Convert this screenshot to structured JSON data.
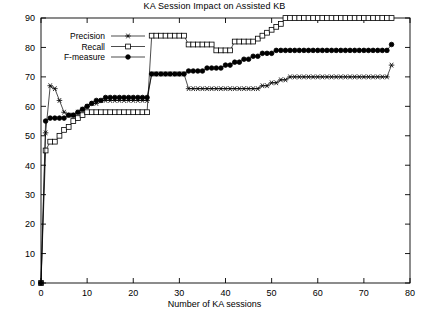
{
  "chart_data": {
    "type": "line",
    "title": "KA Session Impact on Assisted KB",
    "xlabel": "Number of KA sessions",
    "ylabel": "",
    "xlim": [
      0,
      80
    ],
    "ylim": [
      0,
      90
    ],
    "xticks": [
      0,
      10,
      20,
      30,
      40,
      50,
      60,
      70,
      80
    ],
    "yticks": [
      0,
      10,
      20,
      30,
      40,
      50,
      60,
      70,
      80,
      90
    ],
    "grid": false,
    "legend_position": "top-left",
    "x": [
      1,
      2,
      3,
      4,
      5,
      6,
      7,
      8,
      9,
      10,
      11,
      12,
      13,
      14,
      15,
      16,
      17,
      18,
      19,
      20,
      21,
      22,
      23,
      24,
      25,
      26,
      27,
      28,
      29,
      30,
      31,
      32,
      33,
      34,
      35,
      36,
      37,
      38,
      39,
      40,
      41,
      42,
      43,
      44,
      45,
      46,
      47,
      48,
      49,
      50,
      51,
      52,
      53,
      54,
      55,
      56,
      57,
      58,
      59,
      60,
      61,
      62,
      63,
      64,
      65,
      66,
      67,
      68,
      69,
      70,
      71,
      72,
      73,
      74,
      75,
      76
    ],
    "series": [
      {
        "name": "Precision",
        "marker": "star",
        "filled": false,
        "values": [
          51,
          67,
          66,
          62,
          58,
          57,
          57,
          58,
          59,
          60,
          61,
          61,
          62,
          62,
          62,
          62,
          62,
          62,
          62,
          62,
          62,
          62,
          62,
          71,
          71,
          71,
          71,
          71,
          71,
          71,
          71,
          66,
          66,
          66,
          66,
          66,
          66,
          66,
          66,
          66,
          66,
          66,
          66,
          66,
          66,
          66,
          66,
          67,
          67,
          68,
          68,
          69,
          69,
          70,
          70,
          70,
          70,
          70,
          70,
          70,
          70,
          70,
          70,
          70,
          70,
          70,
          70,
          70,
          70,
          70,
          70,
          70,
          70,
          70,
          70,
          74
        ]
      },
      {
        "name": "Recall",
        "marker": "square",
        "filled": false,
        "values": [
          45,
          48,
          48,
          50,
          52,
          53,
          55,
          56,
          57,
          58,
          58,
          58,
          58,
          58,
          58,
          58,
          58,
          58,
          58,
          58,
          58,
          58,
          58,
          84,
          84,
          84,
          84,
          84,
          84,
          84,
          84,
          81,
          81,
          81,
          81,
          81,
          81,
          79,
          79,
          79,
          79,
          82,
          82,
          82,
          82,
          82,
          83,
          84,
          85,
          86,
          87,
          88,
          90,
          90,
          90,
          90,
          90,
          90,
          90,
          90,
          90,
          90,
          90,
          90,
          90,
          90,
          90,
          90,
          90,
          90,
          90,
          90,
          90,
          90,
          90,
          90
        ]
      },
      {
        "name": "F-measure",
        "marker": "circle",
        "filled": true,
        "values": [
          55,
          56,
          56,
          56,
          56,
          57,
          57,
          58,
          59,
          60,
          61,
          62,
          62,
          63,
          63,
          63,
          63,
          63,
          63,
          63,
          63,
          63,
          63,
          71,
          71,
          71,
          71,
          71,
          71,
          71,
          71,
          72,
          72,
          72,
          72,
          73,
          73,
          73,
          73,
          74,
          74,
          75,
          75,
          76,
          76,
          77,
          77,
          78,
          78,
          78,
          79,
          79,
          79,
          79,
          79,
          79,
          79,
          79,
          79,
          79,
          79,
          79,
          79,
          79,
          79,
          79,
          79,
          79,
          79,
          79,
          79,
          79,
          79,
          79,
          79,
          81
        ]
      }
    ]
  },
  "legend": {
    "items": [
      {
        "label": "Precision"
      },
      {
        "label": "Recall"
      },
      {
        "label": "F-measure"
      }
    ]
  },
  "colors": {
    "axis": "#000000",
    "line": "#000000",
    "background": "#ffffff"
  }
}
